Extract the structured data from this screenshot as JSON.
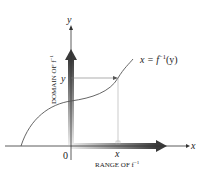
{
  "diagram": {
    "type": "inverse-function-graph",
    "axes": {
      "x_label": "x",
      "y_label": "y",
      "origin_label": "0"
    },
    "curve_label": {
      "lhs": "x = f",
      "sup": "−1",
      "rhs": "(y)"
    },
    "point_labels": {
      "x_value": "x",
      "y_value": "y"
    },
    "domain_label": {
      "text": "DOMAIN OF f",
      "sup": "−1"
    },
    "range_label": {
      "text": "RANGE OF f",
      "sup": "−1"
    },
    "colors": {
      "axis": "#333333",
      "curve": "#555555",
      "thick_arrow_dark": "#3a3a3a",
      "thick_arrow_light": "#e6e6e6",
      "guide_line": "#777777"
    }
  }
}
